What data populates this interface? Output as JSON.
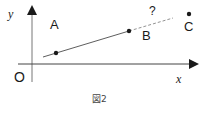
{
  "figure": {
    "caption": "図2",
    "axes": {
      "x_label": "x",
      "y_label": "y",
      "origin_label": "O"
    },
    "points": [
      {
        "id": "A",
        "label": "A"
      },
      {
        "id": "B",
        "label": "B"
      },
      {
        "id": "C",
        "label": "C"
      }
    ],
    "question_mark": "?",
    "colors": {
      "ink": "#1a1a1a",
      "axis": "#1a1a1a",
      "line": "#333333",
      "dashed": "#666666",
      "caption": "#444444"
    }
  }
}
